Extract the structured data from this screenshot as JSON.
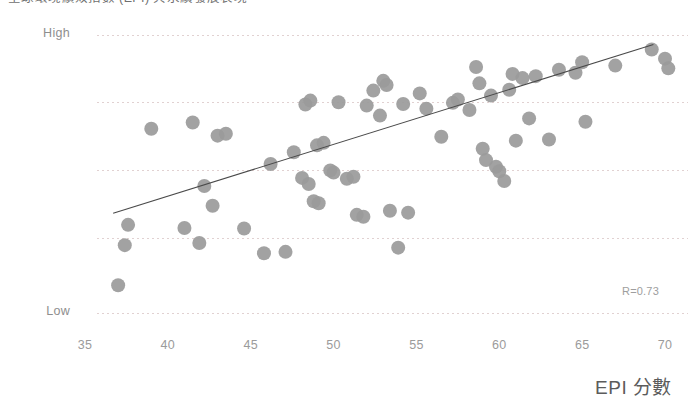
{
  "title": {
    "text": "全球環境績效指數 (EPI) 與永續發展表現"
  },
  "axes": {
    "y": {
      "label_high": "High",
      "label_low": "Low",
      "gridlines_px": [
        35,
        102,
        170,
        238,
        313
      ]
    },
    "x": {
      "title": "EPI 分數",
      "ticks": [
        35,
        40,
        45,
        50,
        55,
        60,
        65,
        70
      ]
    }
  },
  "annotation": {
    "r_value": "R=0.73"
  },
  "colors": {
    "dot": "#9a9a9a",
    "trendline": "#4a4a4a",
    "gridline": "#dcc9c9",
    "background": "#ffffff",
    "tick_text": "#9b9b9b",
    "axis_title": "#5c5c5c"
  },
  "chart_data": {
    "type": "scatter",
    "title": "全球環境績效指數 (EPI) 與永續發展表現",
    "xlabel": "EPI 分數",
    "ylabel": "",
    "xlim": [
      33.5,
      71.5
    ],
    "ylim": [
      0,
      100
    ],
    "y_tick_labels": [
      "Low",
      "",
      "",
      "",
      "High"
    ],
    "y_tick_values": [
      0,
      25,
      50,
      75,
      100
    ],
    "x_tick_values": [
      35,
      40,
      45,
      50,
      55,
      60,
      65,
      70
    ],
    "grid": true,
    "grid_axis": "y",
    "legend": false,
    "correlation": 0.73,
    "annotations": [
      {
        "text": "R=0.73",
        "x": 69.0,
        "y": 7.5
      }
    ],
    "trendline": {
      "type": "linear",
      "x_start": 36.7,
      "y_start": 35.9,
      "x_end": 69.3,
      "y_end": 96.6
    },
    "marker": {
      "shape": "circle",
      "size": 14,
      "color": "#9a9a9a",
      "opacity": 0.92
    },
    "points": [
      {
        "x": 37.6,
        "y": 31.7
      },
      {
        "x": 37.4,
        "y": 24.4
      },
      {
        "x": 37.0,
        "y": 10.0
      },
      {
        "x": 39.0,
        "y": 66.3
      },
      {
        "x": 41.5,
        "y": 68.5
      },
      {
        "x": 41.0,
        "y": 30.6
      },
      {
        "x": 41.9,
        "y": 25.2
      },
      {
        "x": 42.2,
        "y": 45.7
      },
      {
        "x": 42.7,
        "y": 38.6
      },
      {
        "x": 43.0,
        "y": 63.8
      },
      {
        "x": 43.5,
        "y": 64.5
      },
      {
        "x": 44.6,
        "y": 30.4
      },
      {
        "x": 45.8,
        "y": 21.5
      },
      {
        "x": 46.2,
        "y": 53.6
      },
      {
        "x": 47.1,
        "y": 22.0
      },
      {
        "x": 47.6,
        "y": 57.8
      },
      {
        "x": 48.1,
        "y": 48.6
      },
      {
        "x": 48.3,
        "y": 75.0
      },
      {
        "x": 48.5,
        "y": 46.4
      },
      {
        "x": 48.6,
        "y": 76.4
      },
      {
        "x": 48.8,
        "y": 40.2
      },
      {
        "x": 49.1,
        "y": 39.5
      },
      {
        "x": 49.0,
        "y": 60.3
      },
      {
        "x": 49.4,
        "y": 61.2
      },
      {
        "x": 49.8,
        "y": 51.3
      },
      {
        "x": 50.0,
        "y": 50.5
      },
      {
        "x": 50.3,
        "y": 75.8
      },
      {
        "x": 50.8,
        "y": 48.3
      },
      {
        "x": 51.2,
        "y": 49.0
      },
      {
        "x": 51.4,
        "y": 35.3
      },
      {
        "x": 51.8,
        "y": 34.6
      },
      {
        "x": 52.0,
        "y": 74.6
      },
      {
        "x": 52.4,
        "y": 80.0
      },
      {
        "x": 52.8,
        "y": 71.0
      },
      {
        "x": 53.0,
        "y": 83.5
      },
      {
        "x": 53.2,
        "y": 82.0
      },
      {
        "x": 53.4,
        "y": 36.8
      },
      {
        "x": 53.9,
        "y": 23.5
      },
      {
        "x": 54.2,
        "y": 75.2
      },
      {
        "x": 54.5,
        "y": 36.1
      },
      {
        "x": 55.2,
        "y": 79.0
      },
      {
        "x": 55.6,
        "y": 73.5
      },
      {
        "x": 56.5,
        "y": 63.4
      },
      {
        "x": 57.2,
        "y": 75.6
      },
      {
        "x": 57.5,
        "y": 76.8
      },
      {
        "x": 58.2,
        "y": 73.0
      },
      {
        "x": 58.6,
        "y": 88.5
      },
      {
        "x": 58.8,
        "y": 82.6
      },
      {
        "x": 59.0,
        "y": 59.1
      },
      {
        "x": 59.2,
        "y": 55.0
      },
      {
        "x": 59.5,
        "y": 78.2
      },
      {
        "x": 59.8,
        "y": 52.6
      },
      {
        "x": 60.0,
        "y": 51.0
      },
      {
        "x": 60.3,
        "y": 47.5
      },
      {
        "x": 60.6,
        "y": 80.3
      },
      {
        "x": 60.8,
        "y": 86.0
      },
      {
        "x": 61.0,
        "y": 62.0
      },
      {
        "x": 61.4,
        "y": 84.5
      },
      {
        "x": 61.8,
        "y": 70.0
      },
      {
        "x": 62.2,
        "y": 85.2
      },
      {
        "x": 63.0,
        "y": 62.4
      },
      {
        "x": 63.6,
        "y": 87.5
      },
      {
        "x": 64.6,
        "y": 86.4
      },
      {
        "x": 65.0,
        "y": 90.2
      },
      {
        "x": 65.2,
        "y": 68.8
      },
      {
        "x": 67.0,
        "y": 89.0
      },
      {
        "x": 69.2,
        "y": 94.8
      },
      {
        "x": 70.0,
        "y": 91.5
      },
      {
        "x": 70.2,
        "y": 88.0
      }
    ]
  }
}
